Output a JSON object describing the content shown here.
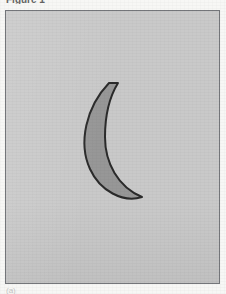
{
  "page": {
    "width": 226,
    "height": 294,
    "paper_color": "#f7f7f5",
    "kind": "scanned-figure-page"
  },
  "caption_top": {
    "text": "Figure 1",
    "note": "cropped at top edge of screenshot"
  },
  "caption_bottom": {
    "text": "(a)",
    "note": "faint, cropped at bottom edge of screenshot"
  },
  "figure_panel": {
    "background_color": "#c9c9c9",
    "border_color": "#74767a",
    "x": 5,
    "y": 10,
    "width": 215,
    "height": 274
  },
  "shape": {
    "name": "crescent",
    "label": "crescent",
    "fill_color": "#979797",
    "stroke_color": "#2b2b2b",
    "stroke_width": 2,
    "upper_tip": "108,82",
    "lower_tip": "140,189",
    "leftmost_x": 84,
    "path": "M 103 72 C 80 96, 72 132, 84 158 C 94 180, 117 192, 136 186 C 112 176, 99 152, 99 126 C 99 103, 104 85, 112 72 Z"
  }
}
